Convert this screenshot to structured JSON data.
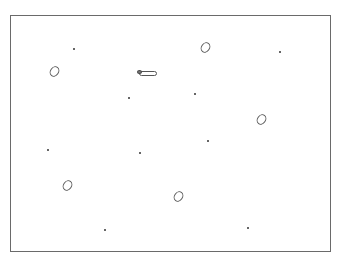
{
  "canvas": {
    "frame": {
      "x": 10,
      "y": 15,
      "width": 321,
      "height": 237,
      "border_color": "#6a6a6a"
    },
    "ovals": [
      {
        "id": "oval-1",
        "x": 50,
        "y": 66
      },
      {
        "id": "oval-2",
        "x": 201,
        "y": 42
      },
      {
        "id": "oval-3",
        "x": 257,
        "y": 114
      },
      {
        "id": "oval-4",
        "x": 63,
        "y": 180
      },
      {
        "id": "oval-5",
        "x": 174,
        "y": 191
      }
    ],
    "pill": {
      "x": 139,
      "y": 71,
      "width": 18
    },
    "dots": [
      {
        "x": 73,
        "y": 48
      },
      {
        "x": 279,
        "y": 51
      },
      {
        "x": 128,
        "y": 97
      },
      {
        "x": 194,
        "y": 93
      },
      {
        "x": 47,
        "y": 149
      },
      {
        "x": 139,
        "y": 152
      },
      {
        "x": 207,
        "y": 140
      },
      {
        "x": 104,
        "y": 229
      },
      {
        "x": 247,
        "y": 227
      }
    ]
  }
}
